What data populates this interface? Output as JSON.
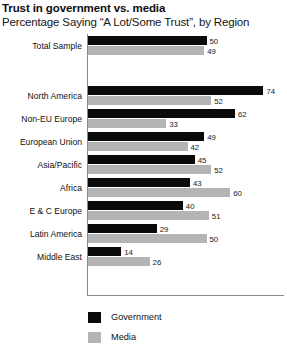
{
  "chart_data": {
    "type": "bar",
    "title": "Trust in government vs. media",
    "subtitle": "Percentage Saying “A Lot/Some Trust”, by Region",
    "xlabel": "",
    "ylabel": "",
    "orientation": "horizontal",
    "xlim": [
      0,
      80
    ],
    "grid": false,
    "legend_position": "bottom-left",
    "categories": [
      "Total Sample",
      "North America",
      "Non-EU Europe",
      "European Union",
      "Asia/Pacific",
      "Africa",
      "E & C Europe",
      "Latin America",
      "Middle East"
    ],
    "series": [
      {
        "name": "Government",
        "color": "#0a0a0a",
        "values": [
          50,
          74,
          62,
          49,
          45,
          43,
          40,
          29,
          14
        ]
      },
      {
        "name": "Media",
        "color": "#b4b4b4",
        "values": [
          49,
          52,
          33,
          42,
          52,
          60,
          51,
          50,
          26
        ]
      }
    ]
  },
  "legend": {
    "items": [
      {
        "label": "Government",
        "swatch": "gov"
      },
      {
        "label": "Media",
        "swatch": "media"
      }
    ]
  }
}
